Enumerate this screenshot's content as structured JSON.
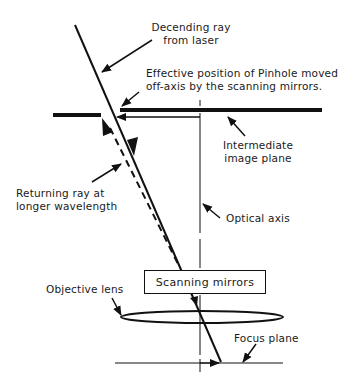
{
  "diagram": {
    "type": "optical-schematic",
    "labels": {
      "descending_ray": [
        "Decending ray",
        "from laser"
      ],
      "pinhole": [
        "Effective position of Pinhole moved",
        "off-axis by the scanning  mirrors."
      ],
      "intermediate_plane": [
        "Intermediate",
        "image plane"
      ],
      "returning_ray": [
        "Returning ray at",
        "longer wavelength"
      ],
      "optical_axis": "Optical axis",
      "scanning_mirrors": "Scanning mirrors",
      "objective_lens": "Objective lens",
      "focus_plane": "Focus plane"
    },
    "colors": {
      "ink": "#111111",
      "background": "#ffffff"
    }
  }
}
